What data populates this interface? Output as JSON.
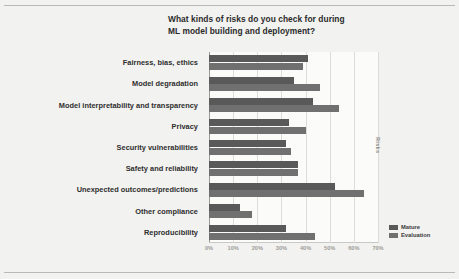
{
  "chart_data": {
    "type": "bar",
    "orientation": "horizontal",
    "grouped": true,
    "title": "What kinds of risks do you check for during ML model building and deployment?",
    "title_lines": [
      "What kinds of risks do you check for during",
      "ML model building and deployment?"
    ],
    "xlabel": "",
    "ylabel": "Risks",
    "xlim": [
      0,
      70
    ],
    "xtick_labels": [
      "0%",
      "10%",
      "20%",
      "30%",
      "40%",
      "50%",
      "60%",
      "70%"
    ],
    "xtick_values": [
      0,
      10,
      20,
      30,
      40,
      50,
      60,
      70
    ],
    "grid": true,
    "grid_axis": "x",
    "legend_position": "bottom-right",
    "categories": [
      "Fairness, bias, ethics",
      "Model degradation",
      "Model interpretability and transparency",
      "Privacy",
      "Security vulnerabilities",
      "Safety and reliability",
      "Unexpected outcomes/predictions",
      "Other compliance",
      "Reproducibility"
    ],
    "series": [
      {
        "name": "Mature",
        "color": "#595959",
        "values": [
          41,
          35,
          43,
          33,
          32,
          37,
          52,
          13,
          32
        ]
      },
      {
        "name": "Evaluation",
        "color": "#707070",
        "values": [
          39,
          46,
          54,
          40,
          34,
          37,
          64,
          18,
          44
        ]
      }
    ]
  },
  "legend": {
    "items": [
      {
        "label": "Mature"
      },
      {
        "label": "Evaluation"
      }
    ]
  },
  "colors": {
    "page_background": "#f2f2f0",
    "plot_background": "#fbfbfa",
    "gridline": "#dcdcd8",
    "mature": "#595959",
    "evaluation": "#707070",
    "text": "#2b2b2b"
  }
}
